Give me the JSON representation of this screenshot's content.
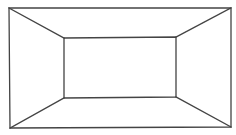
{
  "diagram": {
    "type": "perspective-box",
    "width": 236,
    "height": 135,
    "background": "#ffffff",
    "stroke": "#444444",
    "stroke_width": 1.3,
    "outer_rect": {
      "top_left": [
        9,
        8
      ],
      "top_right": [
        231,
        8
      ],
      "bottom_right": [
        231,
        127
      ],
      "bottom_left": [
        10,
        128
      ]
    },
    "inner_rect": {
      "top_left": [
        64,
        38
      ],
      "top_right": [
        176,
        37
      ],
      "bottom_right": [
        176,
        97
      ],
      "bottom_left": [
        64,
        98
      ]
    },
    "connectors": [
      {
        "name": "top-left-edge",
        "from": [
          9,
          8
        ],
        "to": [
          64,
          38
        ]
      },
      {
        "name": "top-right-edge",
        "from": [
          231,
          8
        ],
        "to": [
          176,
          37
        ]
      },
      {
        "name": "bottom-right-edge",
        "from": [
          231,
          127
        ],
        "to": [
          176,
          97
        ]
      },
      {
        "name": "bottom-left-edge",
        "from": [
          10,
          128
        ],
        "to": [
          64,
          98
        ]
      }
    ]
  }
}
